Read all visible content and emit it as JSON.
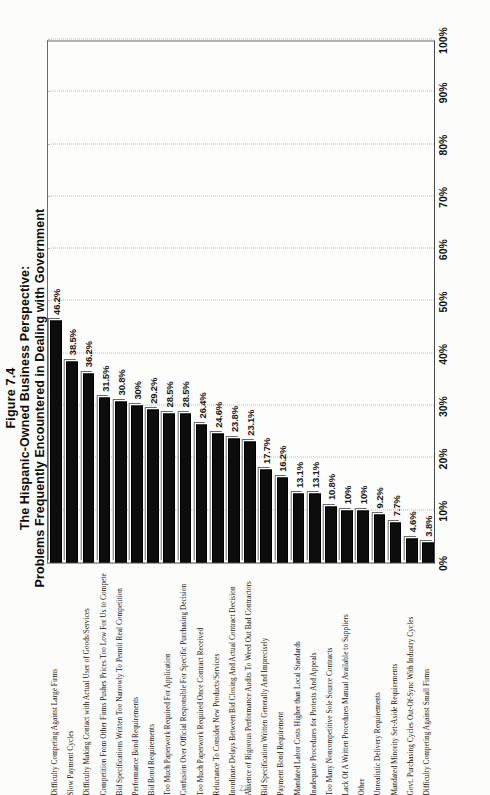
{
  "figure": {
    "number": "Figure 7.4",
    "title_line1": "The Hispanic-Owned Business Perspective:",
    "title_line2": "Problems Frequently Encountered in Dealing with Government",
    "folio": "223"
  },
  "chart_data": {
    "type": "bar",
    "orientation": "horizontal",
    "title": "Figure 7.4 The Hispanic-Owned Business Perspective: Problems Frequently Encountered in Dealing with Government",
    "xlabel": "",
    "ylabel": "",
    "xlim": [
      0,
      100
    ],
    "grid": true,
    "legend": false,
    "tick_labels": [
      "0%",
      "10%",
      "20%",
      "30%",
      "40%",
      "50%",
      "60%",
      "70%",
      "80%",
      "90%",
      "100%"
    ],
    "tick_values": [
      0,
      10,
      20,
      30,
      40,
      50,
      60,
      70,
      80,
      90,
      100
    ],
    "categories": [
      "Difficulty Competing Against Large Firms",
      "Slow Payment Cycles",
      "Difficulty Making Contact with Actual User of Goods/Services",
      "Competition From Other Firms Pushes Prices Too Low For Us to Compete",
      "Bid Specifications Written Too Narrowly To Permit Real Competition",
      "Performance Bond Requirements",
      "Bid Bond Requirements",
      "Too Much Paperwork Required For Application",
      "Confusion Over Official Responsible For Specific Purchasing Decision",
      "Too Much Paperwork Required Once Contract Received",
      "Reluctance To Consider New Products/Services",
      "Inordinate Delays Between Bid Closing And Actual Contract Decision",
      "Absence of Rigorous Performance Audits To Weed Out Bad Contractors",
      "Bid Specification Written Generally And Imprecisely",
      "Payment Bond Requirement",
      "Mandated Labor Costs Higher than Local Standards",
      "Inadequate Procedures for Protests And Appeals",
      "Too Many Noncompetitive Sole Source Contracts",
      "Lack Of A Written Procedures Manual Available to Suppliers",
      "Other",
      "Unrealistic Delivery Requirements",
      "Mandated Minority Set-Aside Requirements",
      "Govt. Purchasing Cycles Out-Of-Sync With Industry Cycles",
      "Difficulty Competing Against Small Firms"
    ],
    "values": [
      46.2,
      38.5,
      36.2,
      31.5,
      30.8,
      30,
      29.2,
      28.5,
      28.5,
      26.4,
      24.6,
      23.8,
      23.1,
      17.7,
      16.2,
      13.1,
      13.1,
      10.8,
      10,
      10,
      9.2,
      7.7,
      4.6,
      3.8
    ],
    "value_labels": [
      "46.2%",
      "38.5%",
      "36.2%",
      "31.5%",
      "30.8%",
      "30%",
      "29.2%",
      "28.5%",
      "28.5%",
      "26.4%",
      "24.6%",
      "23.8%",
      "23.1%",
      "17.7%",
      "16.2%",
      "13.1%",
      "13.1%",
      "10.8%",
      "10%",
      "10%",
      "9.2%",
      "7.7%",
      "4.6%",
      "3.8%"
    ],
    "bar_color": "#0d0d0d"
  }
}
